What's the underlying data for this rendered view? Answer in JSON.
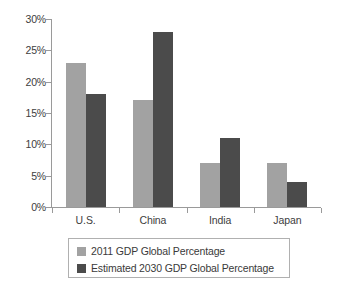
{
  "chart_data": {
    "type": "bar",
    "title": "",
    "xlabel": "",
    "ylabel": "",
    "categories": [
      "U.S.",
      "China",
      "India",
      "Japan"
    ],
    "series": [
      {
        "name": "2011 GDP Global Percentage",
        "color": "#a2a2a2",
        "values": [
          23,
          17,
          7,
          7
        ]
      },
      {
        "name": "Estimated 2030 GDP Global Percentage",
        "color": "#4b4b4b",
        "values": [
          18,
          28,
          11,
          4
        ]
      }
    ],
    "ylim": [
      0,
      30
    ],
    "y_tick_values": [
      0,
      5,
      10,
      15,
      20,
      25,
      30
    ],
    "y_tick_labels": [
      "0%",
      "5%",
      "10%",
      "15%",
      "20%",
      "25%",
      "30%"
    ],
    "grid": false,
    "legend_position": "bottom",
    "axis_color": "#9a9a9a",
    "background_color": "#ffffff"
  }
}
